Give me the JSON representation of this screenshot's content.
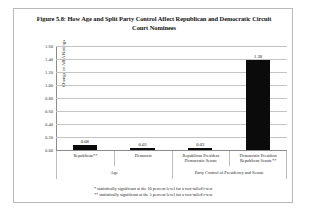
{
  "figure": {
    "title": "Figure 5.8: How Age and Split Party Control Affect Republican and Democratic Circuit Court Nominees",
    "footnotes": [
      "* statistically significant at the 10 percent level for a two-tailed t-test",
      "** statistically significant at the 5 percent level for a two-tailed t-test"
    ]
  },
  "chart_data": {
    "type": "bar",
    "title": "Figure 5.8: How Age and Split Party Control Affect Republican and Democratic Circuit Court Nominees",
    "xlabel": "",
    "ylabel": "Change in ABA Ratings",
    "ylim": [
      0.0,
      1.6
    ],
    "ytick_labels": [
      "1.60",
      "1.40",
      "1.20",
      "1.00",
      "0.80",
      "0.60",
      "0.40",
      "0.20",
      "0.00"
    ],
    "ytick_values": [
      1.6,
      1.4,
      1.2,
      1.0,
      0.8,
      0.6,
      0.4,
      0.2,
      0.0
    ],
    "grid": true,
    "legend": false,
    "bar_color": "#0b0b0b",
    "categories": [
      "Republican**",
      "Democrat",
      "Republican President Democratic Senate",
      "Democratic President Republican Senate**"
    ],
    "values": [
      0.08,
      0.03,
      0.03,
      1.38
    ],
    "value_labels": [
      "0.08",
      "0.03",
      "0.03",
      "1.38"
    ],
    "group_labels": [
      "Age",
      "Party Control of Presidency and Senate"
    ],
    "group_spans": [
      2,
      2
    ]
  }
}
